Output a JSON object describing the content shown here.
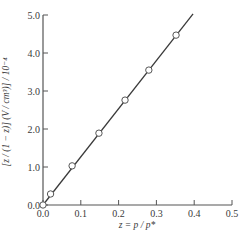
{
  "chart_data": {
    "type": "scatter",
    "title": "",
    "xlabel": "z = p / p*",
    "ylabel": "[z / (1 − z)] (V / cm³)] / 10⁻⁴",
    "xlim": [
      0.0,
      0.5
    ],
    "ylim": [
      0.0,
      5.0
    ],
    "x_ticks": [
      "0.0",
      "0.1",
      "0.2",
      "0.3",
      "0.4",
      "0.5"
    ],
    "y_ticks": [
      "0.0",
      "1.0",
      "2.0",
      "3.0",
      "4.0",
      "5.0"
    ],
    "grid": false,
    "legend": null,
    "series": [
      {
        "name": "data points",
        "marker": "open-circle",
        "x": [
          0.0,
          0.02,
          0.077,
          0.148,
          0.217,
          0.28,
          0.352
        ],
        "y": [
          0.0,
          0.29,
          1.03,
          1.89,
          2.76,
          3.55,
          4.47
        ]
      },
      {
        "name": "linear fit",
        "style": "line",
        "x": [
          0.0,
          0.397
        ],
        "y": [
          0.0,
          5.03
        ]
      }
    ],
    "colors": {
      "axis": "#555555",
      "line": "#3a3a3a",
      "marker_fill": "#ffffff",
      "marker_edge": "#555555"
    }
  }
}
